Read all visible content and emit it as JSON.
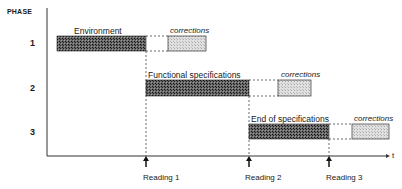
{
  "diagram": {
    "y_axis_label": "PHASE",
    "x_axis_label": "t",
    "phases": [
      {
        "number": "1",
        "task_label": "Environment",
        "corrections_label": "corrections"
      },
      {
        "number": "2",
        "task_label": "Functional specifications",
        "corrections_label": "corrections"
      },
      {
        "number": "3",
        "task_label": "End of  specifications",
        "corrections_label": "corrections"
      }
    ],
    "milestones": [
      {
        "label": "Reading 1"
      },
      {
        "label": "Reading  2"
      },
      {
        "label": "Reading 3"
      }
    ],
    "colors": {
      "task_fill": "#3a3a3a",
      "corrections_fill": "#cfcfcf",
      "line": "#222222"
    }
  }
}
